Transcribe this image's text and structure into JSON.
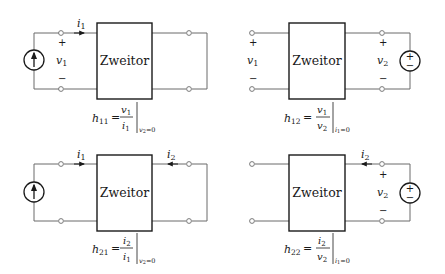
{
  "colors": {
    "line": "#6a6a6a",
    "ink": "#1a1a1a",
    "background": "#ffffff"
  },
  "block_label": "Zweitor",
  "panels": [
    {
      "id": "h11",
      "source": "current-source-left",
      "currents": {
        "i1": "i",
        "i1_sub": "1"
      },
      "voltages": {
        "v1": "v",
        "v1_sub": "1",
        "plus": "+",
        "minus": "−"
      },
      "formula": {
        "lhs": "h",
        "lhs_sub": "11",
        "eq": "=",
        "num": "v",
        "num_sub": "1",
        "den": "i",
        "den_sub": "1",
        "condition": "v",
        "cond_sub": "2",
        "cond_val": "=0"
      }
    },
    {
      "id": "h12",
      "source": "voltage-source-right",
      "voltages": {
        "v1": "v",
        "v1_sub": "1",
        "v2": "v",
        "v2_sub": "2",
        "plus": "+",
        "minus": "−"
      },
      "formula": {
        "lhs": "h",
        "lhs_sub": "12",
        "eq": "=",
        "num": "v",
        "num_sub": "1",
        "den": "v",
        "den_sub": "2",
        "condition": "i",
        "cond_sub": "1",
        "cond_val": "=0"
      }
    },
    {
      "id": "h21",
      "source": "current-source-left",
      "currents": {
        "i1": "i",
        "i1_sub": "1",
        "i2": "i",
        "i2_sub": "2"
      },
      "formula": {
        "lhs": "h",
        "lhs_sub": "21",
        "eq": "=",
        "num": "i",
        "num_sub": "2",
        "den": "i",
        "den_sub": "1",
        "condition": "v",
        "cond_sub": "2",
        "cond_val": "=0"
      }
    },
    {
      "id": "h22",
      "source": "voltage-source-right",
      "currents": {
        "i2": "i",
        "i2_sub": "2"
      },
      "voltages": {
        "v2": "v",
        "v2_sub": "2",
        "plus": "+",
        "minus": "−"
      },
      "formula": {
        "lhs": "h",
        "lhs_sub": "22",
        "eq": "=",
        "num": "i",
        "num_sub": "2",
        "den": "v",
        "den_sub": "2",
        "condition": "i",
        "cond_sub": "1",
        "cond_val": "=0"
      }
    }
  ],
  "source_signs": {
    "plus": "+",
    "minus": "−"
  }
}
